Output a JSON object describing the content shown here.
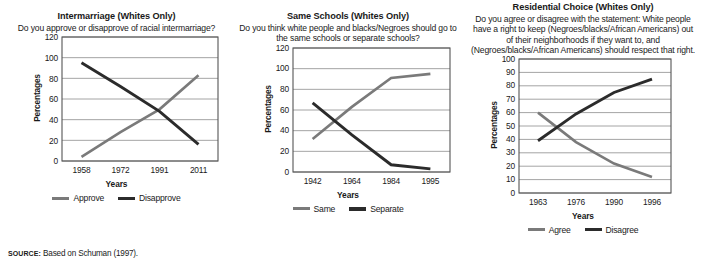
{
  "figure": {
    "source_prefix": "SOURCE:",
    "source_text": " Based on Schuman (1997).",
    "colors": {
      "series_light": "#7a7a7a",
      "series_dark": "#2b2b2b",
      "frame": "#555555",
      "grid": "#8d8d8d",
      "text": "#1a1a1a"
    }
  },
  "chart_data": [
    {
      "type": "line",
      "title": "Intermarriage (Whites Only)",
      "subtitle": "Do you approve or disapprove of racial intermarriage?",
      "xlabel": "Years",
      "ylabel": "Percentages",
      "categories": [
        "1958",
        "1972",
        "1991",
        "2011"
      ],
      "ytick_labels": [
        "0",
        "20",
        "40",
        "60",
        "80",
        "100",
        "120"
      ],
      "ylim": [
        0,
        120
      ],
      "grid": true,
      "legend_position": "bottom",
      "series": [
        {
          "name": "Approve",
          "color": "#7a7a7a",
          "values": [
            4,
            28,
            50,
            83
          ]
        },
        {
          "name": "Disapprove",
          "color": "#2b2b2b",
          "values": [
            95,
            72,
            48,
            16
          ]
        }
      ]
    },
    {
      "type": "line",
      "title": "Same Schools (Whites Only)",
      "subtitle": "Do you think white people and blacks/Negroes should go to the same schools or separate schools?",
      "xlabel": "Years",
      "ylabel": "Percentages",
      "categories": [
        "1942",
        "1964",
        "1984",
        "1995"
      ],
      "ytick_labels": [
        "0",
        "20",
        "40",
        "60",
        "80",
        "100",
        "120"
      ],
      "ylim": [
        0,
        120
      ],
      "grid": true,
      "legend_position": "bottom",
      "series": [
        {
          "name": "Same",
          "color": "#7a7a7a",
          "values": [
            32,
            63,
            91,
            95
          ]
        },
        {
          "name": "Separate",
          "color": "#2b2b2b",
          "values": [
            67,
            36,
            7,
            3
          ]
        }
      ]
    },
    {
      "type": "line",
      "title": "Residential Choice (Whites Only)",
      "subtitle": "Do you agree or disagree with the statement: White people have a right to keep (Negroes/blacks/African Americans) out of their neighborhoods if they want to, and (Negroes/blacks/African Americans) should respect that right.",
      "xlabel": "Years",
      "ylabel": "Percentages",
      "categories": [
        "1963",
        "1976",
        "1990",
        "1996"
      ],
      "ytick_labels": [
        "0",
        "10",
        "20",
        "30",
        "40",
        "50",
        "60",
        "70",
        "80",
        "90",
        "100"
      ],
      "ylim": [
        0,
        100
      ],
      "grid": true,
      "legend_position": "bottom",
      "series": [
        {
          "name": "Agree",
          "color": "#7a7a7a",
          "values": [
            60,
            38,
            22,
            12
          ]
        },
        {
          "name": "Disagree",
          "color": "#2b2b2b",
          "values": [
            39,
            59,
            75,
            85
          ]
        }
      ]
    }
  ]
}
